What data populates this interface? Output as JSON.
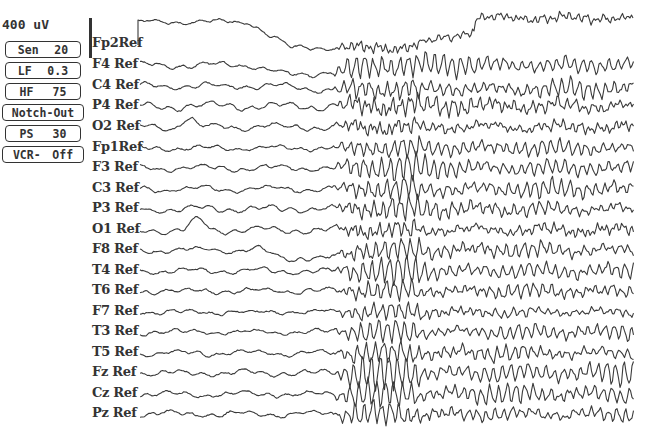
{
  "display": {
    "scale_label": "400 uV",
    "trace_color": "#3a3a3a",
    "background": "#ffffff"
  },
  "controls": [
    {
      "name": "sensitivity",
      "label": "Sen",
      "value": "20"
    },
    {
      "name": "low-filter",
      "label": "LF",
      "value": "0.3"
    },
    {
      "name": "high-filter",
      "label": "HF",
      "value": "75"
    },
    {
      "name": "notch",
      "label": "Notch-Out",
      "value": ""
    },
    {
      "name": "paper-speed",
      "label": "PS",
      "value": "30"
    },
    {
      "name": "vcr",
      "label": "VCR-",
      "value": "Off"
    }
  ],
  "channels": [
    {
      "label": "Fp2Ref",
      "y": 44,
      "bg": 2.5,
      "burst": 4,
      "drift": "fp2"
    },
    {
      "label": "F4 Ref",
      "y": 65,
      "bg": 3,
      "burst": 14,
      "drift": "f4"
    },
    {
      "label": "C4 Ref",
      "y": 86,
      "bg": 3,
      "burst": 11,
      "drift": "c4"
    },
    {
      "label": "P4 Ref",
      "y": 106,
      "bg": 4,
      "burst": 9,
      "drift": "none"
    },
    {
      "label": "O2 Ref",
      "y": 127,
      "bg": 3.5,
      "burst": 6,
      "drift": "o2"
    },
    {
      "label": "Fp1Ref",
      "y": 148,
      "bg": 2.5,
      "burst": 10,
      "drift": "none"
    },
    {
      "label": "F3 Ref",
      "y": 168,
      "bg": 3,
      "burst": 14,
      "drift": "none"
    },
    {
      "label": "C3 Ref",
      "y": 189,
      "bg": 3,
      "burst": 11,
      "drift": "none"
    },
    {
      "label": "P3 Ref",
      "y": 209,
      "bg": 3.5,
      "burst": 10,
      "drift": "none"
    },
    {
      "label": "O1 Ref",
      "y": 230,
      "bg": 3.5,
      "burst": 6,
      "drift": "o1"
    },
    {
      "label": "F8 Ref",
      "y": 250,
      "bg": 3,
      "burst": 9,
      "drift": "f8"
    },
    {
      "label": "T4 Ref",
      "y": 271,
      "bg": 3,
      "burst": 13,
      "drift": "none"
    },
    {
      "label": "T6 Ref",
      "y": 291,
      "bg": 3,
      "burst": 8,
      "drift": "none"
    },
    {
      "label": "F7 Ref",
      "y": 312,
      "bg": 2.5,
      "burst": 7,
      "drift": "none"
    },
    {
      "label": "T3 Ref",
      "y": 332,
      "bg": 2.5,
      "burst": 10,
      "drift": "none"
    },
    {
      "label": "T5 Ref",
      "y": 353,
      "bg": 3,
      "burst": 9,
      "drift": "none"
    },
    {
      "label": "Fz Ref",
      "y": 373,
      "bg": 3,
      "burst": 16,
      "drift": "none"
    },
    {
      "label": "Cz Ref",
      "y": 394,
      "bg": 3,
      "burst": 12,
      "drift": "none"
    },
    {
      "label": "Pz Ref",
      "y": 414,
      "bg": 3,
      "burst": 10,
      "drift": "none"
    }
  ],
  "trace_layout": {
    "x_start": 140,
    "x_end": 634,
    "burst_onset_x": 330
  }
}
